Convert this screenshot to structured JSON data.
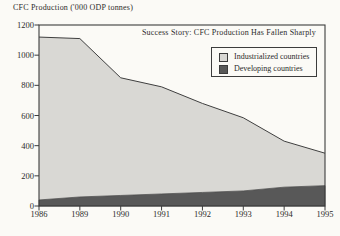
{
  "chart": {
    "axis_title": "CFC Production ('000 ODP tonnes)",
    "annotation": "Success Story: CFC Production Has Fallen Sharply"
  },
  "chart_data": {
    "type": "area",
    "stacked": true,
    "title": "Success Story: CFC Production Has Fallen Sharply",
    "ylabel": "CFC Production ('000 ODP tonnes)",
    "xlabel": "",
    "categories": [
      "1986",
      "1989",
      "1990",
      "1991",
      "1992",
      "1993",
      "1994",
      "1995"
    ],
    "series": [
      {
        "name": "Developing countries",
        "color": "#585858",
        "values": [
          40,
          60,
          70,
          80,
          90,
          100,
          125,
          135
        ]
      },
      {
        "name": "Industrialized countries",
        "color": "#d9d8d4",
        "values": [
          1080,
          1050,
          780,
          710,
          590,
          485,
          305,
          215
        ]
      }
    ],
    "totals": [
      1120,
      1110,
      850,
      790,
      680,
      585,
      430,
      350
    ],
    "ylim": [
      0,
      1200
    ],
    "y_ticks": [
      0,
      200,
      400,
      600,
      800,
      1000,
      1200
    ],
    "grid": false,
    "legend": {
      "position": "top-right",
      "entries": [
        {
          "label": "Industrialized countries",
          "color": "#d9d8d4"
        },
        {
          "label": "Developing countries",
          "color": "#585858"
        }
      ]
    }
  },
  "colors": {
    "frame": "#3c3c3c",
    "line": "#3f3f3f",
    "text": "#2b2b2b",
    "paper": "#fbfaf6"
  }
}
